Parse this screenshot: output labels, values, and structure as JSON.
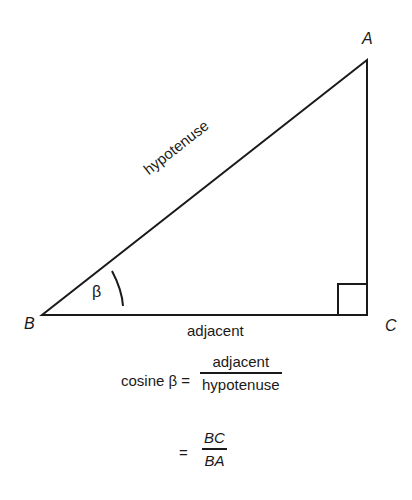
{
  "diagram": {
    "type": "right-triangle",
    "vertices": {
      "A": {
        "label": "A",
        "x": 367,
        "y": 60
      },
      "B": {
        "label": "B",
        "x": 42,
        "y": 315
      },
      "C": {
        "label": "C",
        "x": 367,
        "y": 315
      }
    },
    "angle_label": "β",
    "sides": {
      "hypotenuse": "hypotenuse",
      "adjacent": "adjacent"
    },
    "stroke_color": "#1a1a1a"
  },
  "formula": {
    "lhs": "cosine β =",
    "fraction1": {
      "numerator": "adjacent",
      "denominator": "hypotenuse"
    },
    "equals": "=",
    "fraction2": {
      "numerator": "BC",
      "denominator": "BA"
    }
  }
}
